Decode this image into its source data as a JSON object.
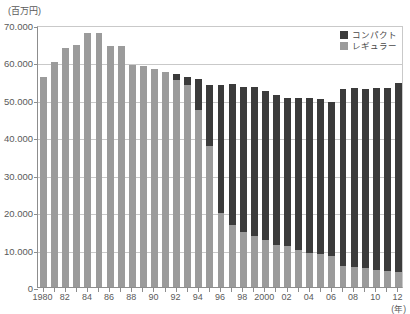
{
  "chart_data": {
    "type": "bar",
    "stacked": true,
    "title": "",
    "subtitle": "",
    "xlabel": "(年)",
    "ylabel": "(百万円)",
    "unit_label": "(百万円)",
    "x_unit_label": "(年)",
    "ylim": [
      0,
      70000
    ],
    "ytick_step": 10000,
    "grid": true,
    "legend_position": "top-right",
    "categories": [
      "1980",
      "1981",
      "1982",
      "1983",
      "1984",
      "1985",
      "1986",
      "1987",
      "1988",
      "1989",
      "1990",
      "1991",
      "1992",
      "1993",
      "1994",
      "1995",
      "1996",
      "1997",
      "1998",
      "1999",
      "2000",
      "2001",
      "2002",
      "2003",
      "2004",
      "2005",
      "2006",
      "2007",
      "2008",
      "2009",
      "2010",
      "2011",
      "2012"
    ],
    "tick_labels": [
      "1980",
      "",
      "82",
      "",
      "84",
      "",
      "86",
      "",
      "88",
      "",
      "90",
      "",
      "92",
      "",
      "94",
      "",
      "96",
      "",
      "98",
      "",
      "2000",
      "",
      "02",
      "",
      "04",
      "",
      "06",
      "",
      "08",
      "",
      "10",
      "",
      "12"
    ],
    "ytick_labels": [
      "0",
      "10.000",
      "20.000",
      "30.000",
      "40.000",
      "50.000",
      "60.000",
      "70.000"
    ],
    "series": [
      {
        "name": "レギュラー",
        "color": "#9b9b9b",
        "values": [
          56200,
          60100,
          63800,
          64600,
          67800,
          67900,
          64400,
          64500,
          59300,
          59100,
          58200,
          57500,
          55300,
          54100,
          47300,
          37600,
          19700,
          16600,
          14600,
          13600,
          12600,
          11300,
          10900,
          9800,
          9200,
          8700,
          8400,
          5600,
          5400,
          5200,
          4600,
          4300,
          4100
        ]
      },
      {
        "name": "コンパクト",
        "color": "#3b3b3b",
        "values": [
          0,
          0,
          0,
          0,
          0,
          0,
          0,
          0,
          0,
          0,
          0,
          0,
          1700,
          2100,
          8200,
          16400,
          34300,
          37600,
          38900,
          39800,
          39900,
          40100,
          39500,
          40700,
          41300,
          41600,
          40900,
          47200,
          47800,
          47700,
          48500,
          48800,
          50400
        ]
      }
    ],
    "totals": [
      56200,
      60100,
      63800,
      64600,
      67800,
      67900,
      64400,
      64500,
      59300,
      59100,
      58200,
      57500,
      57000,
      56200,
      55500,
      54000,
      54000,
      54200,
      53500,
      53400,
      52500,
      51400,
      50400,
      50500,
      50500,
      50300,
      49300,
      52800,
      53200,
      52900,
      53100,
      53100,
      54500
    ]
  },
  "legend": {
    "items": [
      {
        "label": "コンパクト",
        "color": "#3b3b3b",
        "swatch_name": "legend-swatch-compact"
      },
      {
        "label": "レギュラー",
        "color": "#9b9b9b",
        "swatch_name": "legend-swatch-regular"
      }
    ]
  }
}
